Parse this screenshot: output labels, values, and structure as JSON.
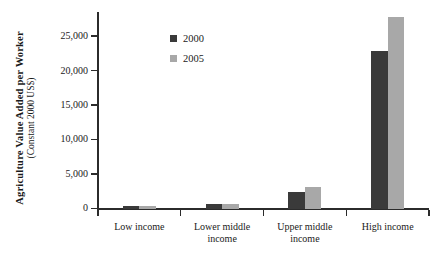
{
  "chart_data": {
    "type": "bar",
    "title": "",
    "xlabel": "",
    "ylabel": "Agriculture Value Added per Worker",
    "ylabel_sub": "(Constant 2000 US$)",
    "categories": [
      "Low income",
      "Lower middle\nincome",
      "Upper middle\nincome",
      "High income"
    ],
    "ytick_labels": [
      "0",
      "5,000",
      "10,000",
      "15,000",
      "20,000",
      "25,000"
    ],
    "ytick_values": [
      0,
      5000,
      10000,
      15000,
      20000,
      25000
    ],
    "ylim": [
      0,
      28500
    ],
    "grid": false,
    "legend_position": "upper-center-left",
    "series": [
      {
        "name": "2000",
        "color": "#3a3a3a",
        "values": [
          370,
          700,
          2450,
          23000
        ]
      },
      {
        "name": "2005",
        "color": "#a8a8a8",
        "values": [
          430,
          800,
          3180,
          27800
        ]
      }
    ]
  },
  "axis": {
    "axis_color": "#2b2b2b"
  }
}
